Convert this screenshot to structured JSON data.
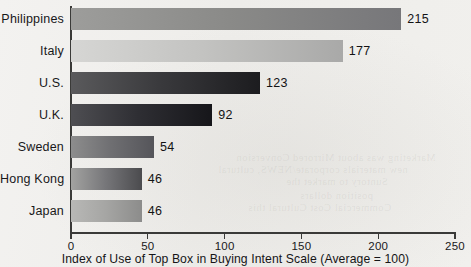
{
  "chart_data": {
    "type": "bar",
    "orientation": "horizontal",
    "title": "",
    "xlabel": "Index of Use of Top Box in Buying Intent Scale (Average = 100)",
    "ylabel": "",
    "categories": [
      "Philippines",
      "Italy",
      "U.S.",
      "U.K.",
      "Sweden",
      "Hong Kong",
      "Japan"
    ],
    "values": [
      215,
      177,
      123,
      92,
      54,
      46,
      46
    ],
    "value_labels": [
      "215",
      "177",
      "123",
      "92",
      "54",
      "46",
      "46"
    ],
    "xlim": [
      0,
      250
    ],
    "xticks": [
      0,
      50,
      100,
      150,
      200,
      250
    ],
    "xtick_labels": [
      "0",
      "50",
      "100",
      "150",
      "200",
      "250"
    ],
    "grid": false,
    "legend": "none",
    "bar_fills": [
      {
        "name": "Philippines",
        "from": "#9d9d9b",
        "to": "#77777a",
        "mid": "#8a8a88"
      },
      {
        "name": "Italy",
        "from": "#d6d6d4",
        "to": "#a9a9a8",
        "mid": "#c3c3c1"
      },
      {
        "name": "U.S.",
        "from": "#5a5a5c",
        "to": "#1c1c1f",
        "mid": "#39393c"
      },
      {
        "name": "U.K.",
        "from": "#4e4e52",
        "to": "#16161a",
        "mid": "#2e2e33"
      },
      {
        "name": "Sweden",
        "from": "#8d8d8d",
        "to": "#55555a",
        "mid": "#6f6f72"
      },
      {
        "name": "Hong Kong",
        "from": "#a3a3a1",
        "to": "#4b4b4e",
        "mid": "#77777a"
      },
      {
        "name": "Japan",
        "from": "#b8b8b6",
        "to": "#8c8c8b",
        "mid": "#a6a6a4"
      }
    ],
    "axis_color": "#3a3a38",
    "background_color": "#f0efed",
    "text_color": "#18181a"
  },
  "bleed_text": {
    "line1": "Marketing was about Mirrored Conversion",
    "line2": "new materials corporate/NEWS, cultural",
    "line3": "Suntory to market the",
    "line4": "position dollars",
    "line5": "Commercial Cost Cultural this"
  }
}
